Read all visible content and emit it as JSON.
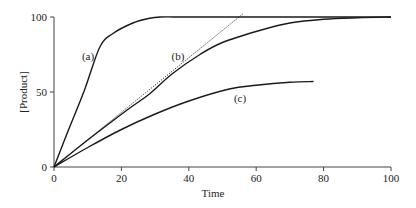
{
  "chart_data": {
    "type": "line",
    "title": "",
    "xlabel": "Time",
    "ylabel": "[Product]",
    "xlim": [
      0,
      100
    ],
    "ylim": [
      0,
      100
    ],
    "xticks": [
      0,
      20,
      40,
      60,
      80,
      100
    ],
    "yticks": [
      0,
      50,
      100
    ],
    "grid": false,
    "legend": "none (curves labelled inline)",
    "series": [
      {
        "name": "(a)",
        "style": "solid",
        "x": [
          0,
          4,
          9,
          13.6,
          17.5,
          23.4,
          28,
          31.5,
          40,
          60,
          80,
          100
        ],
        "y": [
          0,
          23,
          51,
          80,
          89,
          96,
          99,
          100,
          100,
          100,
          100,
          100
        ]
      },
      {
        "name": "(b)",
        "style": "solid",
        "x": [
          0,
          10,
          21.7,
          28.5,
          35,
          43.3,
          50,
          61,
          70,
          80,
          90,
          100
        ],
        "y": [
          0,
          18,
          38,
          49,
          62,
          75,
          83,
          91,
          96,
          98.5,
          99.5,
          100
        ]
      },
      {
        "name": "(c)",
        "style": "solid",
        "x": [
          0,
          10,
          20,
          29.7,
          40,
          52,
          60,
          70,
          77
        ],
        "y": [
          0,
          13,
          25,
          35,
          44,
          52,
          54.5,
          56.5,
          57
        ]
      },
      {
        "name": "initial rate tangent to (b)",
        "style": "dotted",
        "x": [
          0,
          56
        ],
        "y": [
          0,
          102
        ]
      }
    ],
    "annotations": [
      {
        "text": "(a)",
        "x": 10,
        "y": 74
      },
      {
        "text": "(b)",
        "x": 36.8,
        "y": 74
      },
      {
        "text": "(c)",
        "x": 55.2,
        "y": 46
      }
    ]
  },
  "labels": {
    "x_axis": "Time",
    "y_axis": "[Product]",
    "curve_a": "(a)",
    "curve_b": "(b)",
    "curve_c": "(c)",
    "xtick_0": "0",
    "xtick_20": "20",
    "xtick_40": "40",
    "xtick_60": "60",
    "xtick_80": "80",
    "xtick_100": "100",
    "ytick_0": "0",
    "ytick_50": "50",
    "ytick_100": "100"
  }
}
